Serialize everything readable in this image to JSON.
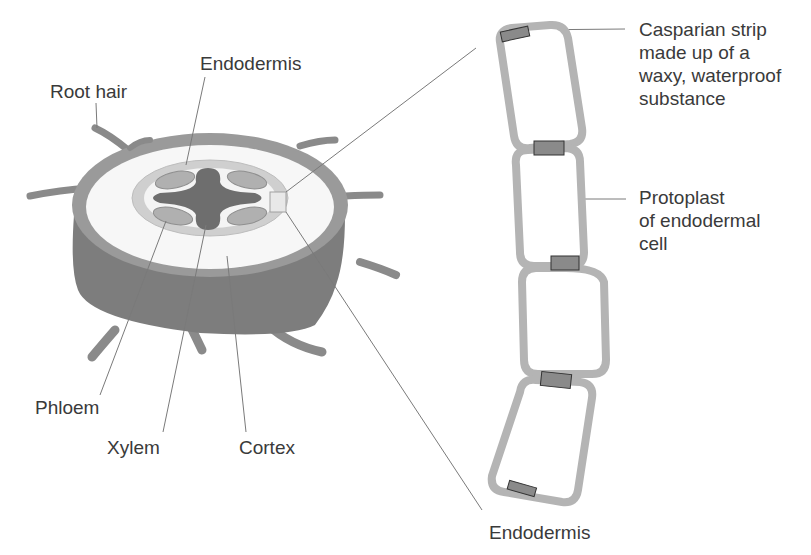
{
  "figure": {
    "colors": {
      "background": "#ffffff",
      "label_text": "#3a3a3a",
      "leader_line": "#7a7a7a",
      "epidermis_side": "#7d7d7d",
      "epidermis_top_rim": "#9a9a9a",
      "cortex": "#f7f7f7",
      "endodermis_ring": "#c8c8c8",
      "xylem": "#6e6e6e",
      "phloem": "#b0b0b0",
      "cell_wall": "#b4b4b4",
      "casparian_strip": "#8a8a8a"
    }
  },
  "labels": {
    "root_hair": "Root hair",
    "endodermis_top": "Endodermis",
    "phloem": "Phloem",
    "xylem": "Xylem",
    "cortex": "Cortex",
    "casparian_strip": [
      "Casparian strip",
      "made up of a",
      "waxy, waterproof",
      "substance"
    ],
    "protoplast": [
      "Protoplast",
      "of endodermal",
      "cell"
    ],
    "endodermis_bottom": "Endodermis"
  }
}
